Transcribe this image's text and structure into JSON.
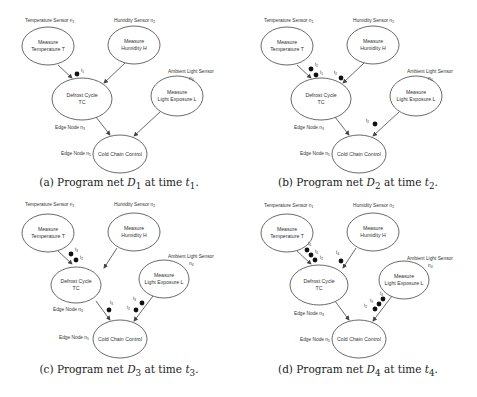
{
  "figure": {
    "nodes": {
      "temp": {
        "line1": "Measure",
        "line2": "Temperature T",
        "label": "Temperature Sensor n",
        "sub": "1"
      },
      "hum": {
        "line1": "Measure",
        "line2": "Humidity H",
        "label": "Humidity Sensor n",
        "sub": "2"
      },
      "defrost": {
        "line1": "Defrost Cycle",
        "line2": "TC",
        "label": "Edge Node n",
        "sub": "3"
      },
      "light": {
        "line1": "Measure",
        "line2": "Light Exposure L",
        "label": "Ambient Light Sensor",
        "label2": "n",
        "sub": "4"
      },
      "cold": {
        "line1": "Cold Chain Control",
        "label": "Edge Node n",
        "sub": "5"
      }
    },
    "panels": [
      {
        "id": "a",
        "caption_prefix": "(a) Program net ",
        "net": "D",
        "net_sub": "1",
        "caption_mid": " at time ",
        "time": "t",
        "time_sub": "1",
        "caption_end": "."
      },
      {
        "id": "b",
        "caption_prefix": "(b) Program net ",
        "net": "D",
        "net_sub": "2",
        "caption_mid": " at time ",
        "time": "t",
        "time_sub": "2",
        "caption_end": "."
      },
      {
        "id": "c",
        "caption_prefix": "(c) Program net ",
        "net": "D",
        "net_sub": "3",
        "caption_mid": " at time ",
        "time": "t",
        "time_sub": "3",
        "caption_end": "."
      },
      {
        "id": "d",
        "caption_prefix": "(d) Program net ",
        "net": "D",
        "net_sub": "4",
        "caption_mid": " at time ",
        "time": "t",
        "time_sub": "4",
        "caption_end": "."
      }
    ],
    "tokens": {
      "a": {
        "temp_edge": [
          "t1"
        ],
        "hum_edge": [],
        "defrost_edge": [],
        "light_edge": []
      },
      "b": {
        "temp_edge": [
          "t2",
          "t1"
        ],
        "hum_edge": [
          "t2"
        ],
        "defrost_edge": [],
        "light_edge": [
          "t2"
        ]
      },
      "c": {
        "temp_edge": [
          "t3",
          "t2"
        ],
        "hum_edge": [],
        "defrost_edge": [
          "t3"
        ],
        "light_edge": [
          "t3",
          "t2"
        ]
      },
      "d": {
        "temp_edge": [
          "t4",
          "t3",
          "t2"
        ],
        "hum_edge": [
          "t4"
        ],
        "defrost_edge": [],
        "light_edge": [
          "t4",
          "t3",
          "t2"
        ]
      }
    },
    "colors": {
      "stroke": "#444444",
      "token": "#111111",
      "text": "#333333"
    }
  }
}
